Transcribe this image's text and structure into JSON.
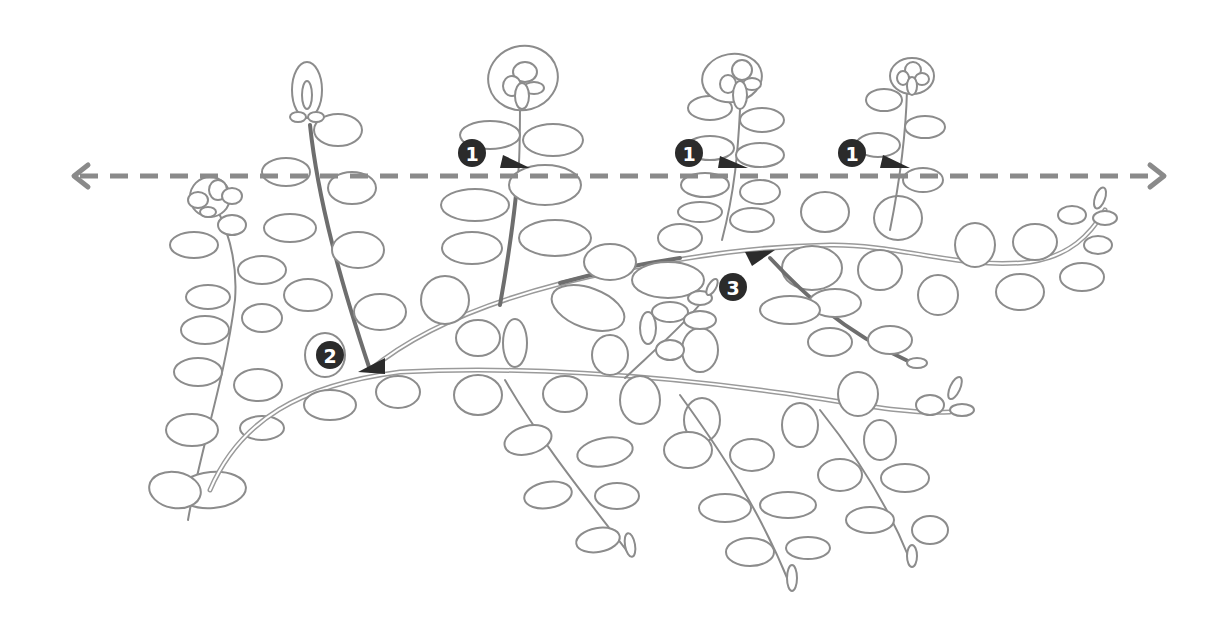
{
  "diagram": {
    "type": "botanical line illustration",
    "colors": {
      "line": "#8c8c8c",
      "marker": "#2b2b2b",
      "marker_text": "#ffffff",
      "background": "#ffffff"
    },
    "guide_line": {
      "style": "dashed",
      "arrows": "both ends",
      "y": 176,
      "x_start": 72,
      "x_end": 1164,
      "icon_left": "arrow-left-icon",
      "icon_right": "arrow-right-icon"
    },
    "markers": [
      {
        "label": "1",
        "x": 472,
        "y": 153,
        "pointer": {
          "x": 512,
          "y": 165,
          "direction": "right"
        }
      },
      {
        "label": "1",
        "x": 689,
        "y": 153,
        "pointer": {
          "x": 728,
          "y": 163,
          "direction": "right"
        }
      },
      {
        "label": "1",
        "x": 852,
        "y": 153,
        "pointer": {
          "x": 890,
          "y": 165,
          "direction": "right"
        }
      },
      {
        "label": "2",
        "x": 330,
        "y": 355,
        "pointer": {
          "x": 370,
          "y": 368,
          "direction": "down-right"
        }
      },
      {
        "label": "3",
        "x": 733,
        "y": 287,
        "pointer": {
          "x": 760,
          "y": 258,
          "direction": "up-left"
        }
      }
    ]
  }
}
